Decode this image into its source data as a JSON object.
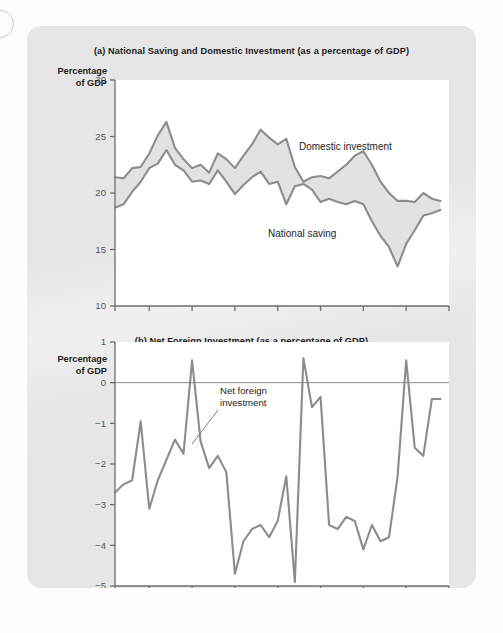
{
  "figure": {
    "panel_bg": "#e6e6e6",
    "plot_bg": "#ffffff",
    "line_color": "#8c8c8c",
    "band_fill": "#e2e2e2",
    "axis_color": "#6b6e70"
  },
  "panel_a": {
    "title": "(a) National Saving and Domestic Investment (as a percentage of GDP)",
    "y_axis_label_line1": "Percentage",
    "y_axis_label_line2": "of GDP",
    "label_domestic": "Domestic investment",
    "label_national": "National saving"
  },
  "panel_b": {
    "title": "(b) Net Foreign Investment (as a percentage of GDP)",
    "y_axis_label_line1": "Percentage",
    "y_axis_label_line2": "of GDP",
    "annotation_line1": "Net foreign",
    "annotation_line2": "investment"
  },
  "chart_data": [
    {
      "id": "chart-a",
      "type": "line",
      "title": "(a) National Saving and Domestic Investment (as a percentage of GDP)",
      "xlabel": "",
      "ylabel": "Percentage of GDP",
      "xlim": [
        1961,
        2000
      ],
      "ylim": [
        10,
        30
      ],
      "yticks": [
        10,
        15,
        20,
        25,
        30
      ],
      "xticks": [
        1961,
        1965,
        1970,
        1975,
        1980,
        1985,
        1990,
        1995,
        2000
      ],
      "grid": false,
      "legend": "inline-labels",
      "shaded_band": true,
      "x": [
        1961,
        1962,
        1963,
        1964,
        1965,
        1966,
        1967,
        1968,
        1969,
        1970,
        1971,
        1972,
        1973,
        1974,
        1975,
        1976,
        1977,
        1978,
        1979,
        1980,
        1981,
        1982,
        1983,
        1984,
        1985,
        1986,
        1987,
        1988,
        1989,
        1990,
        1991,
        1992,
        1993,
        1994,
        1995,
        1996,
        1997,
        1998,
        1999
      ],
      "series": [
        {
          "name": "Domestic investment",
          "values": [
            21.4,
            21.3,
            22.2,
            22.3,
            23.5,
            25.1,
            26.3,
            24.0,
            23.0,
            22.2,
            22.5,
            21.8,
            23.5,
            23.0,
            22.2,
            23.3,
            24.3,
            25.6,
            24.9,
            24.3,
            24.8,
            22.3,
            21.0,
            21.4,
            21.5,
            21.3,
            21.9,
            22.5,
            23.3,
            23.7,
            22.5,
            21.0,
            20.0,
            19.3,
            19.3,
            19.2,
            20.0,
            19.5,
            19.3
          ]
        },
        {
          "name": "National saving",
          "values": [
            18.7,
            19.0,
            20.1,
            21.0,
            22.2,
            22.6,
            23.8,
            22.5,
            22.0,
            21.0,
            21.1,
            20.8,
            22.0,
            21.0,
            19.9,
            20.7,
            21.4,
            21.9,
            20.8,
            21.0,
            19.0,
            20.6,
            20.8,
            20.3,
            19.2,
            19.5,
            19.2,
            19.0,
            19.3,
            19.0,
            17.5,
            16.2,
            15.2,
            13.5,
            15.5,
            16.7,
            18.0,
            18.2,
            18.5
          ]
        }
      ]
    },
    {
      "id": "chart-b",
      "type": "line",
      "title": "(b) Net Foreign Investment (as a percentage of GDP)",
      "xlabel": "",
      "ylabel": "Percentage of GDP",
      "xlim": [
        1961,
        2000
      ],
      "ylim": [
        -5,
        1
      ],
      "yticks": [
        1,
        0,
        -1,
        -2,
        -3,
        -4,
        -5
      ],
      "ytick_labels": [
        "1",
        "0",
        "−1",
        "−2",
        "−3",
        "−4",
        "−5"
      ],
      "xticks": [
        1961,
        1965,
        1970,
        1975,
        1980,
        1985,
        1990,
        1995,
        2000
      ],
      "grid": false,
      "zero_line": true,
      "annotation": "Net foreign investment",
      "x": [
        1961,
        1962,
        1963,
        1964,
        1965,
        1966,
        1967,
        1968,
        1969,
        1970,
        1971,
        1972,
        1973,
        1974,
        1975,
        1976,
        1977,
        1978,
        1979,
        1980,
        1981,
        1982,
        1983,
        1984,
        1985,
        1986,
        1987,
        1988,
        1989,
        1990,
        1991,
        1992,
        1993,
        1994,
        1995,
        1996,
        1997,
        1998,
        1999
      ],
      "series": [
        {
          "name": "Net foreign investment",
          "values": [
            -2.7,
            -2.5,
            -2.4,
            -0.95,
            -3.1,
            -2.4,
            -1.9,
            -1.4,
            -1.75,
            0.55,
            -1.45,
            -2.1,
            -1.8,
            -2.2,
            -4.7,
            -3.9,
            -3.6,
            -3.5,
            -3.8,
            -3.4,
            -2.3,
            -4.9,
            0.6,
            -0.6,
            -0.35,
            -3.5,
            -3.6,
            -3.3,
            -3.4,
            -4.1,
            -3.5,
            -3.9,
            -3.8,
            -2.3,
            0.55,
            -1.6,
            -1.8,
            -0.4,
            -0.4
          ]
        }
      ]
    }
  ]
}
